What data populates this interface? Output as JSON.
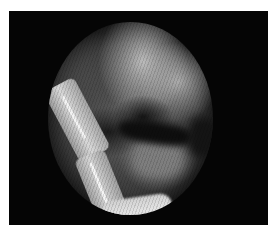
{
  "image": {
    "description": "Grayscale circular endoscopic/arthroscopic view inside a black rectangular frame on white background",
    "colors": {
      "background": "#ffffff",
      "frame": "#050505",
      "instrument": "#d8d8d8",
      "tissue_light": "#bcbcbc",
      "tissue_dark": "#151515"
    }
  }
}
